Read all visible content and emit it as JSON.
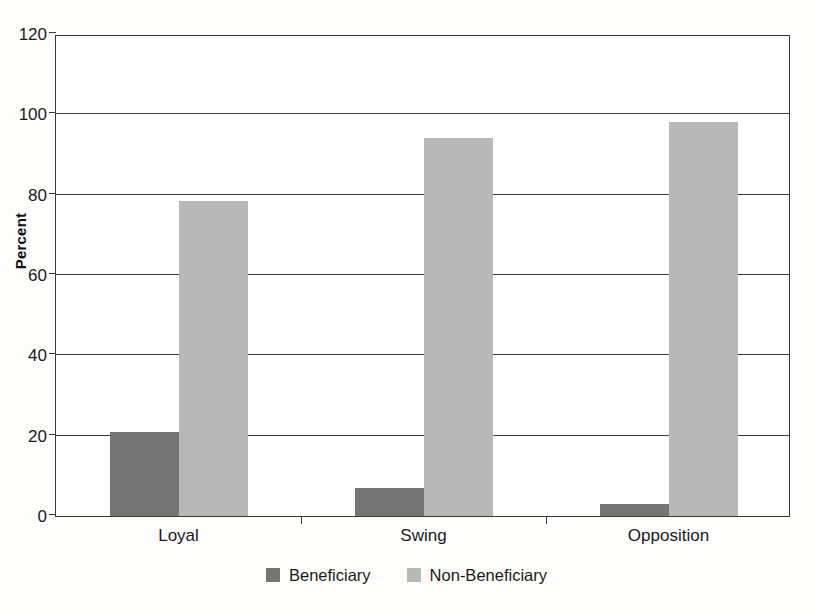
{
  "chart_data": {
    "type": "bar",
    "title": "",
    "xlabel": "",
    "ylabel": "Percent",
    "categories": [
      "Loyal",
      "Swing",
      "Opposition"
    ],
    "series": [
      {
        "name": "Beneficiary",
        "color": "#757575",
        "values": [
          21,
          7,
          3
        ]
      },
      {
        "name": "Non-Beneficiary",
        "color": "#b8b8b8",
        "values": [
          78.5,
          94,
          98
        ]
      }
    ],
    "ylim": [
      0,
      120
    ],
    "yticks": [
      0,
      20,
      40,
      60,
      80,
      100,
      120
    ],
    "ytick_labels": [
      "0",
      "20",
      "40",
      "60",
      "80",
      "100",
      "120"
    ],
    "grid": "horizontal",
    "legend_position": "bottom-center",
    "axis_color": "#3a3a3a",
    "plot_background": "#ffffff",
    "figure_background": "#fdfdfc"
  },
  "legend": {
    "items": [
      {
        "label": "Beneficiary",
        "color": "#757575"
      },
      {
        "label": "Non-Beneficiary",
        "color": "#b8b8b8"
      }
    ]
  }
}
